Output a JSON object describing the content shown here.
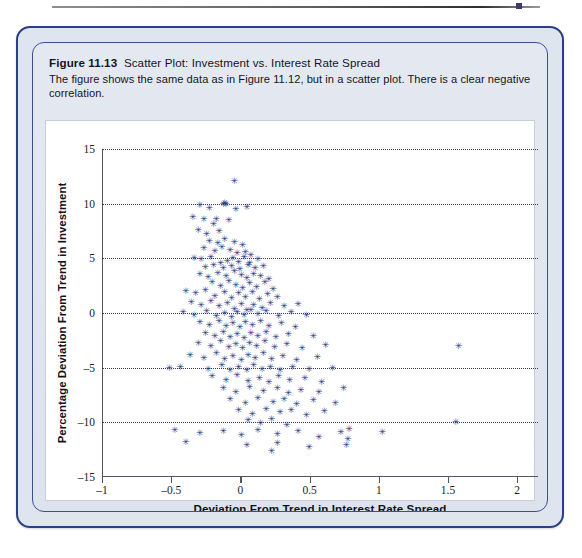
{
  "figure": {
    "number": "Figure 11.13",
    "title": "Scatter Plot: Investment vs. Interest Rate Spread",
    "description": "The figure shows the same data as in Figure 11.12, but in a scatter plot. There is a clear negative correlation.",
    "frame_color": "#2c3f86",
    "panel_color": "#dfe5ee"
  },
  "chart_data": {
    "type": "scatter",
    "title": "Scatter Plot: Investment vs. Interest Rate Spread",
    "xlabel": "Deviation From Trend in Interest Rate Spread",
    "ylabel": "Percentage Deviation From Trend in Investment",
    "xlim": [
      -1,
      2.15
    ],
    "ylim": [
      -15,
      15
    ],
    "xticks": [
      -1,
      -0.5,
      0,
      0.5,
      1,
      1.5,
      2
    ],
    "xtick_labels": [
      "-1",
      "-0.5",
      "0",
      "0.5",
      "1",
      "1.5",
      "2"
    ],
    "yticks": [
      15,
      10,
      5,
      0,
      -5,
      -10,
      -15
    ],
    "ytick_labels": [
      "15",
      "10",
      "5",
      "0",
      "-5",
      "-10",
      "-15"
    ],
    "gridlines": [
      15,
      10,
      5,
      0,
      -5,
      -10
    ],
    "grid": true,
    "grid_style": "dotted-horizontal",
    "legend": null,
    "marker": "asterisk",
    "marker_color": "#2a3b86",
    "annotation": "clear negative correlation",
    "points": [
      [
        -0.05,
        12.1
      ],
      [
        -0.3,
        9.9
      ],
      [
        -0.23,
        9.6
      ],
      [
        -0.13,
        10.0
      ],
      [
        -0.12,
        10.1
      ],
      [
        -0.11,
        10.0
      ],
      [
        -0.04,
        9.5
      ],
      [
        0.04,
        9.7
      ],
      [
        -0.35,
        8.8
      ],
      [
        -0.27,
        8.6
      ],
      [
        -0.2,
        8.1
      ],
      [
        -0.18,
        8.6
      ],
      [
        -0.09,
        8.5
      ],
      [
        -0.31,
        7.6
      ],
      [
        -0.25,
        7.2
      ],
      [
        -0.16,
        7.5
      ],
      [
        -0.23,
        6.6
      ],
      [
        -0.17,
        6.4
      ],
      [
        -0.12,
        6.8
      ],
      [
        -0.05,
        6.5
      ],
      [
        0.01,
        6.2
      ],
      [
        -0.27,
        5.9
      ],
      [
        -0.19,
        5.7
      ],
      [
        -0.14,
        6.0
      ],
      [
        -0.08,
        5.8
      ],
      [
        -0.03,
        5.5
      ],
      [
        0.03,
        5.6
      ],
      [
        0.07,
        5.3
      ],
      [
        -0.34,
        5.0
      ],
      [
        -0.29,
        4.9
      ],
      [
        -0.22,
        5.1
      ],
      [
        -0.15,
        4.6
      ],
      [
        -0.1,
        4.8
      ],
      [
        -0.06,
        5.0
      ],
      [
        -0.02,
        4.7
      ],
      [
        0.02,
        5.1
      ],
      [
        0.06,
        4.6
      ],
      [
        0.12,
        4.9
      ],
      [
        -0.26,
        4.2
      ],
      [
        -0.2,
        4.4
      ],
      [
        -0.13,
        4.1
      ],
      [
        -0.07,
        4.3
      ],
      [
        -0.01,
        4.0
      ],
      [
        0.05,
        4.4
      ],
      [
        0.1,
        4.1
      ],
      [
        0.16,
        4.3
      ],
      [
        -0.3,
        3.6
      ],
      [
        -0.24,
        3.3
      ],
      [
        -0.17,
        3.7
      ],
      [
        -0.11,
        3.4
      ],
      [
        -0.05,
        3.8
      ],
      [
        0.0,
        3.5
      ],
      [
        0.04,
        3.2
      ],
      [
        0.09,
        3.6
      ],
      [
        0.14,
        3.4
      ],
      [
        0.2,
        3.1
      ],
      [
        -0.21,
        2.8
      ],
      [
        -0.15,
        2.5
      ],
      [
        -0.09,
        2.9
      ],
      [
        -0.04,
        2.6
      ],
      [
        0.01,
        2.3
      ],
      [
        0.06,
        2.7
      ],
      [
        0.11,
        2.4
      ],
      [
        0.17,
        2.8
      ],
      [
        0.23,
        2.2
      ],
      [
        -0.4,
        2.0
      ],
      [
        -0.33,
        1.8
      ],
      [
        -0.26,
        2.1
      ],
      [
        -0.19,
        1.6
      ],
      [
        -0.12,
        1.9
      ],
      [
        -0.07,
        1.4
      ],
      [
        -0.02,
        1.8
      ],
      [
        0.03,
        1.5
      ],
      [
        0.08,
        1.9
      ],
      [
        0.13,
        1.3
      ],
      [
        0.19,
        1.7
      ],
      [
        0.26,
        1.5
      ],
      [
        -0.36,
        1.0
      ],
      [
        -0.29,
        0.7
      ],
      [
        -0.22,
        1.1
      ],
      [
        -0.16,
        0.6
      ],
      [
        -0.1,
        0.9
      ],
      [
        -0.05,
        0.4
      ],
      [
        0.0,
        0.8
      ],
      [
        0.04,
        0.3
      ],
      [
        0.09,
        0.7
      ],
      [
        0.15,
        0.5
      ],
      [
        0.21,
        0.9
      ],
      [
        0.31,
        0.6
      ],
      [
        0.41,
        0.8
      ],
      [
        -0.42,
        0.1
      ],
      [
        -0.34,
        -0.2
      ],
      [
        -0.25,
        0.2
      ],
      [
        -0.18,
        -0.3
      ],
      [
        -0.12,
        0.0
      ],
      [
        -0.07,
        -0.4
      ],
      [
        -0.03,
        0.1
      ],
      [
        0.02,
        -0.2
      ],
      [
        0.07,
        0.3
      ],
      [
        0.12,
        -0.1
      ],
      [
        0.18,
        0.2
      ],
      [
        0.27,
        -0.3
      ],
      [
        0.36,
        0.1
      ],
      [
        0.47,
        -0.2
      ],
      [
        -0.3,
        -0.8
      ],
      [
        -0.23,
        -1.1
      ],
      [
        -0.16,
        -0.7
      ],
      [
        -0.11,
        -1.2
      ],
      [
        -0.06,
        -0.9
      ],
      [
        -0.01,
        -1.3
      ],
      [
        0.03,
        -0.8
      ],
      [
        0.08,
        -1.1
      ],
      [
        0.14,
        -0.7
      ],
      [
        0.2,
        -1.2
      ],
      [
        0.29,
        -0.9
      ],
      [
        0.39,
        -1.3
      ],
      [
        -0.26,
        -1.8
      ],
      [
        -0.19,
        -2.1
      ],
      [
        -0.13,
        -1.7
      ],
      [
        -0.08,
        -2.2
      ],
      [
        -0.03,
        -1.9
      ],
      [
        0.02,
        -2.3
      ],
      [
        0.07,
        -1.8
      ],
      [
        0.12,
        -2.1
      ],
      [
        0.18,
        -1.7
      ],
      [
        0.25,
        -2.2
      ],
      [
        0.34,
        -1.9
      ],
      [
        0.52,
        -2.1
      ],
      [
        -0.31,
        -2.7
      ],
      [
        -0.22,
        -3.0
      ],
      [
        -0.15,
        -2.6
      ],
      [
        -0.09,
        -3.1
      ],
      [
        -0.04,
        -2.8
      ],
      [
        0.01,
        -3.2
      ],
      [
        0.06,
        -2.7
      ],
      [
        0.11,
        -3.0
      ],
      [
        0.17,
        -2.6
      ],
      [
        0.24,
        -3.1
      ],
      [
        0.33,
        -2.8
      ],
      [
        0.44,
        -3.2
      ],
      [
        0.61,
        -2.9
      ],
      [
        1.57,
        -3.0
      ],
      [
        -0.37,
        -3.8
      ],
      [
        -0.27,
        -4.1
      ],
      [
        -0.18,
        -3.7
      ],
      [
        -0.12,
        -4.2
      ],
      [
        -0.06,
        -3.9
      ],
      [
        0.0,
        -4.3
      ],
      [
        0.05,
        -3.8
      ],
      [
        0.1,
        -4.1
      ],
      [
        0.16,
        -3.7
      ],
      [
        0.22,
        -4.2
      ],
      [
        0.3,
        -3.9
      ],
      [
        0.4,
        -4.3
      ],
      [
        0.55,
        -4.0
      ],
      [
        -0.52,
        -5.0
      ],
      [
        -0.44,
        -4.9
      ],
      [
        -0.24,
        -5.1
      ],
      [
        -0.14,
        -4.8
      ],
      [
        -0.08,
        -5.2
      ],
      [
        -0.02,
        -4.9
      ],
      [
        0.04,
        -5.2
      ],
      [
        0.09,
        -4.8
      ],
      [
        0.15,
        -5.1
      ],
      [
        0.21,
        -4.9
      ],
      [
        0.28,
        -5.2
      ],
      [
        0.37,
        -4.9
      ],
      [
        0.49,
        -5.1
      ],
      [
        0.66,
        -5.0
      ],
      [
        -0.21,
        -5.8
      ],
      [
        -0.11,
        -6.1
      ],
      [
        -0.03,
        -5.7
      ],
      [
        0.05,
        -6.2
      ],
      [
        0.13,
        -5.9
      ],
      [
        0.2,
        -6.3
      ],
      [
        0.27,
        -5.8
      ],
      [
        0.35,
        -6.1
      ],
      [
        0.46,
        -5.9
      ],
      [
        0.58,
        -6.3
      ],
      [
        -0.13,
        -6.9
      ],
      [
        -0.04,
        -7.2
      ],
      [
        0.06,
        -6.8
      ],
      [
        0.16,
        -7.1
      ],
      [
        0.26,
        -6.9
      ],
      [
        0.34,
        -7.3
      ],
      [
        0.43,
        -7.0
      ],
      [
        0.56,
        -7.2
      ],
      [
        0.74,
        -6.9
      ],
      [
        -0.08,
        -7.9
      ],
      [
        0.03,
        -8.2
      ],
      [
        0.12,
        -7.8
      ],
      [
        0.23,
        -8.1
      ],
      [
        0.31,
        -7.9
      ],
      [
        0.4,
        -8.3
      ],
      [
        0.52,
        -8.0
      ],
      [
        0.68,
        -8.2
      ],
      [
        -0.02,
        -8.9
      ],
      [
        0.08,
        -9.2
      ],
      [
        0.18,
        -8.8
      ],
      [
        0.28,
        -9.1
      ],
      [
        0.36,
        -8.9
      ],
      [
        0.47,
        -9.3
      ],
      [
        0.6,
        -9.0
      ],
      [
        0.05,
        -9.8
      ],
      [
        0.14,
        -10.1
      ],
      [
        0.22,
        -9.7
      ],
      [
        0.33,
        -10.2
      ],
      [
        1.55,
        -10.0
      ],
      [
        -0.48,
        -10.7
      ],
      [
        -0.3,
        -11.0
      ],
      [
        -0.13,
        -10.8
      ],
      [
        0.0,
        -11.2
      ],
      [
        0.12,
        -10.7
      ],
      [
        0.26,
        -11.1
      ],
      [
        0.41,
        -10.8
      ],
      [
        0.56,
        -11.3
      ],
      [
        0.72,
        -10.9
      ],
      [
        0.77,
        -11.5
      ],
      [
        0.78,
        -10.6
      ],
      [
        1.02,
        -10.9
      ],
      [
        -0.4,
        -11.8
      ],
      [
        0.04,
        -12.1
      ],
      [
        0.26,
        -11.9
      ],
      [
        0.49,
        -12.3
      ],
      [
        0.76,
        -12.1
      ],
      [
        0.22,
        -12.6
      ]
    ]
  }
}
